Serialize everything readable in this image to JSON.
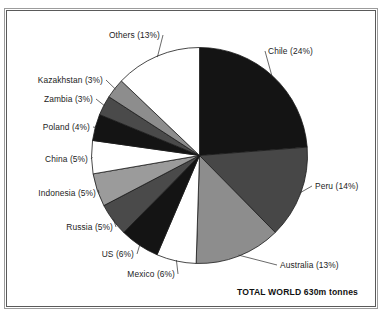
{
  "figure": {
    "frame": true,
    "total_caption": "TOTAL WORLD 630m tonnes",
    "top_clipped_text": ""
  },
  "chart_data": {
    "type": "pie",
    "title": "",
    "subtitle": "",
    "xlabel": "",
    "ylabel": "",
    "unit": "%",
    "total_label": "TOTAL WORLD 630m tonnes",
    "total_value": 630,
    "total_unit": "m tonnes",
    "start_angle_deg": 0,
    "direction": "clockwise",
    "legend": "none (direct labels with leader lines)",
    "grid": false,
    "categories": [
      "Chile",
      "Peru",
      "Australia",
      "Mexico",
      "US",
      "Russia",
      "Indonesia",
      "China",
      "Poland",
      "Zambia",
      "Kazakhstan",
      "Others"
    ],
    "values": [
      24,
      14,
      13,
      6,
      6,
      5,
      5,
      5,
      4,
      3,
      3,
      13
    ],
    "slices": [
      {
        "label": "Chile  (24%)",
        "name": "Chile",
        "value": 24,
        "fill": "#141414",
        "side": "right"
      },
      {
        "label": "Peru (14%)",
        "name": "Peru",
        "value": 14,
        "fill": "#474747",
        "side": "right"
      },
      {
        "label": "Australia (13%)",
        "name": "Australia",
        "value": 13,
        "fill": "#8d8d8d",
        "side": "right"
      },
      {
        "label": "Mexico (6%)",
        "name": "Mexico",
        "value": 6,
        "fill": "#ffffff",
        "side": "left"
      },
      {
        "label": "US (6%)",
        "name": "US",
        "value": 6,
        "fill": "#141414",
        "side": "left"
      },
      {
        "label": "Russia (5%)",
        "name": "Russia",
        "value": 5,
        "fill": "#4a4a4a",
        "side": "left"
      },
      {
        "label": "Indonesia (5%)",
        "name": "Indonesia",
        "value": 5,
        "fill": "#9b9b9b",
        "side": "left"
      },
      {
        "label": "China (5%)",
        "name": "China",
        "value": 5,
        "fill": "#ffffff",
        "side": "left"
      },
      {
        "label": "Poland (4%)",
        "name": "Poland",
        "value": 4,
        "fill": "#141414",
        "side": "left"
      },
      {
        "label": "Zambia (3%)",
        "name": "Zambia",
        "value": 3,
        "fill": "#4a4a4a",
        "side": "left"
      },
      {
        "label": "Kazakhstan (3%)",
        "name": "Kazakhstan",
        "value": 3,
        "fill": "#8d8d8d",
        "side": "left"
      },
      {
        "label": "Others (13%)",
        "name": "Others",
        "value": 13,
        "fill": "#ffffff",
        "side": "left"
      }
    ],
    "colors": {
      "black": "#141414",
      "dark_gray": "#474747",
      "mid_gray": "#8d8d8d",
      "light_gray": "#9b9b9b",
      "white": "#ffffff",
      "outline": "#1a1a1a",
      "frame": "#5a5a5a",
      "text": "#1c1c1c"
    }
  },
  "labels": {
    "chile": "Chile  (24%)",
    "peru": "Peru (14%)",
    "australia": "Australia (13%)",
    "mexico": "Mexico (6%)",
    "us": "US (6%)",
    "russia": "Russia (5%)",
    "indonesia": "Indonesia (5%)",
    "china": "China (5%)",
    "poland": "Poland (4%)",
    "zambia": "Zambia (3%)",
    "kazakhstan": "Kazakhstan (3%)",
    "others": "Others (13%)"
  }
}
